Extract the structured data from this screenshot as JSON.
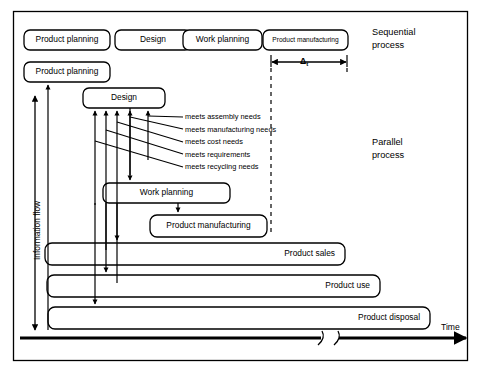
{
  "figure": {
    "title_sections": {
      "sequential": "Sequential\nprocess",
      "sequential_line1": "Sequential",
      "sequential_line2": "process",
      "parallel_line1": "Parallel",
      "parallel_line2": "process"
    },
    "axes": {
      "time_label": "Time",
      "information_flow_label": "Information flow"
    },
    "annotations": {
      "delta_symbol": "Δ",
      "delta_subscript": "t"
    },
    "sequential_boxes": [
      {
        "label": "Product planning",
        "x": 24,
        "y": 30,
        "w": 86,
        "h": 20,
        "size": "normal"
      },
      {
        "label": "Design",
        "x": 115,
        "y": 30,
        "w": 76,
        "h": 20,
        "size": "normal"
      },
      {
        "label": "Work planning",
        "x": 183,
        "y": 30,
        "w": 79,
        "h": 20,
        "size": "normal"
      },
      {
        "label": "Product manufacturing",
        "x": 263,
        "y": 30,
        "w": 85,
        "h": 20,
        "size": "small"
      }
    ],
    "parallel_boxes": [
      {
        "label": "Product planning",
        "x": 24,
        "y": 62,
        "w": 86,
        "h": 20,
        "align": "center",
        "size": "normal"
      },
      {
        "label": "Design",
        "x": 83,
        "y": 88,
        "w": 82,
        "h": 20,
        "align": "center",
        "size": "normal"
      },
      {
        "label": "Work planning",
        "x": 103,
        "y": 183,
        "w": 127,
        "h": 20,
        "align": "center",
        "size": "normal"
      },
      {
        "label": "Product manufacturing",
        "x": 150,
        "y": 215,
        "w": 117,
        "h": 22,
        "align": "center",
        "size": "normal"
      }
    ],
    "lifecycle_bars": [
      {
        "label": "Product sales",
        "x": 45,
        "y": 243,
        "w": 300,
        "h": 22,
        "align": "right"
      },
      {
        "label": "Product use",
        "x": 47,
        "y": 275,
        "w": 333,
        "h": 22,
        "align": "right"
      },
      {
        "label": "Product disposal",
        "x": 48,
        "y": 307,
        "w": 382,
        "h": 22,
        "align": "right"
      }
    ],
    "needs_labels": [
      "meets assembly needs",
      "meets manufacturing needs",
      "meets cost needs",
      "meets requirements",
      "meets recycling needs"
    ]
  }
}
